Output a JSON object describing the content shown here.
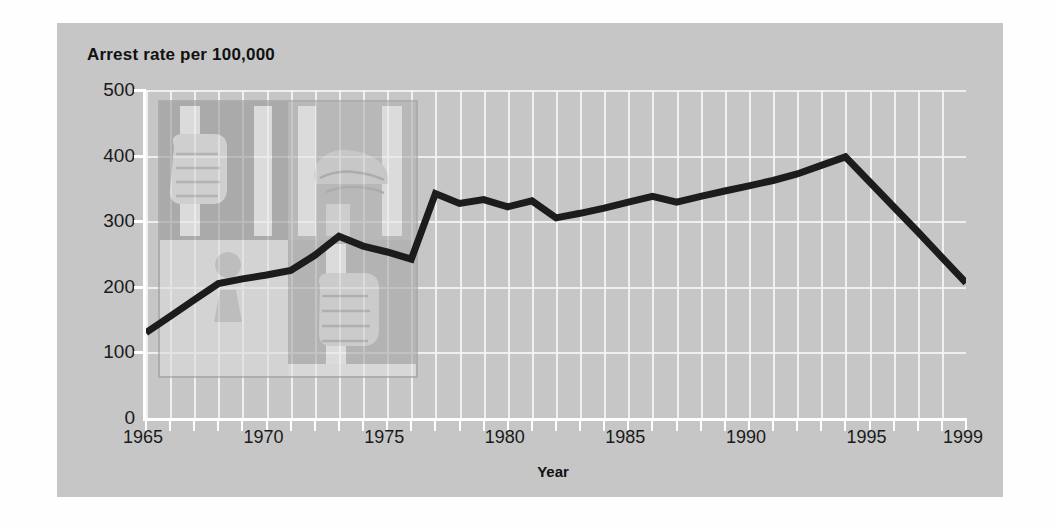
{
  "chart_data": {
    "type": "line",
    "title": "Arrest rate per 100,000",
    "xlabel": "Year",
    "ylabel": "",
    "xlim": [
      1965,
      1999
    ],
    "ylim": [
      0,
      500
    ],
    "grid": true,
    "legend": false,
    "y_ticks": [
      0,
      100,
      200,
      300,
      400,
      500
    ],
    "y_tick_labels": [
      "0",
      "100",
      "200",
      "300",
      "400",
      "500"
    ],
    "x_ticks": [
      1965,
      1970,
      1975,
      1980,
      1985,
      1990,
      1995,
      1999
    ],
    "x_tick_labels": [
      "1965",
      "1970",
      "1975",
      "1980",
      "1985",
      "1990",
      "1995",
      "1999"
    ],
    "x": [
      1965,
      1966,
      1967,
      1968,
      1969,
      1970,
      1971,
      1972,
      1973,
      1974,
      1975,
      1976,
      1977,
      1978,
      1979,
      1980,
      1981,
      1982,
      1983,
      1984,
      1985,
      1986,
      1987,
      1988,
      1989,
      1990,
      1991,
      1992,
      1993,
      1994,
      1995,
      1996,
      1997,
      1998,
      1999
    ],
    "values": [
      130,
      155,
      180,
      205,
      212,
      218,
      225,
      248,
      277,
      262,
      253,
      242,
      342,
      327,
      333,
      322,
      331,
      305,
      312,
      320,
      329,
      338,
      329,
      338,
      346,
      354,
      362,
      372,
      385,
      398,
      360,
      322,
      284,
      245,
      206
    ],
    "series_name": "Arrest rate per 100,000",
    "line_color": "#1c1c1c",
    "line_width": 7,
    "panel_color": "#c6c6c6",
    "grid_color": "#f2f2f2",
    "annotation": "Background watermark illustration: hands gripping prison bars with a keyhole"
  },
  "watermark": {
    "name": "prison-bars-keyhole-illustration",
    "quadrants": [
      {
        "name": "hand-gripping-bar-upper-left",
        "tone": "#9a9a9a"
      },
      {
        "name": "face-behind-bars-upper-right",
        "tone": "#b0b0b0"
      },
      {
        "name": "keyhole-panel-lower-left",
        "tone": "#dcdcdc"
      },
      {
        "name": "hand-gripping-bar-lower-right",
        "tone": "#a8a8a8"
      }
    ]
  }
}
